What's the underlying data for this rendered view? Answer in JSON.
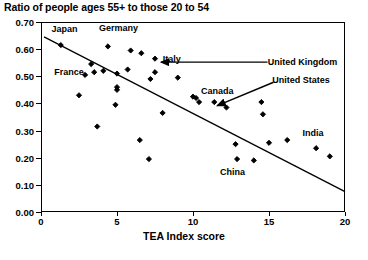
{
  "chart_data": {
    "type": "scatter",
    "title": "Ratio of people ages 55+ to those 20 to 54",
    "xlabel": "TEA Index score",
    "ylabel": "",
    "xlim": [
      0,
      20
    ],
    "ylim": [
      0.0,
      0.7
    ],
    "xticks": [
      0,
      5,
      10,
      15,
      20
    ],
    "xtick_labels": [
      "0",
      "5",
      "10",
      "15",
      "20"
    ],
    "yticks": [
      0.0,
      0.1,
      0.2,
      0.3,
      0.4,
      0.5,
      0.6,
      0.7
    ],
    "ytick_labels": [
      "0.00",
      "0.10",
      "0.20",
      "0.30",
      "0.40",
      "0.50",
      "0.60",
      "0.70"
    ],
    "grid": false,
    "legend": "none",
    "marker": "diamond",
    "marker_color": "#000000",
    "points": [
      {
        "x": 1.3,
        "y": 0.615
      },
      {
        "x": 3.3,
        "y": 0.545
      },
      {
        "x": 3.5,
        "y": 0.515
      },
      {
        "x": 2.9,
        "y": 0.505
      },
      {
        "x": 4.1,
        "y": 0.52
      },
      {
        "x": 4.4,
        "y": 0.61
      },
      {
        "x": 5.9,
        "y": 0.595
      },
      {
        "x": 6.6,
        "y": 0.585
      },
      {
        "x": 5.0,
        "y": 0.51
      },
      {
        "x": 5.7,
        "y": 0.525
      },
      {
        "x": 5.0,
        "y": 0.46
      },
      {
        "x": 5.0,
        "y": 0.45
      },
      {
        "x": 4.9,
        "y": 0.395
      },
      {
        "x": 2.5,
        "y": 0.43
      },
      {
        "x": 7.5,
        "y": 0.565
      },
      {
        "x": 7.5,
        "y": 0.515
      },
      {
        "x": 7.2,
        "y": 0.49
      },
      {
        "x": 9.0,
        "y": 0.495
      },
      {
        "x": 8.0,
        "y": 0.365
      },
      {
        "x": 3.7,
        "y": 0.315
      },
      {
        "x": 6.5,
        "y": 0.265
      },
      {
        "x": 7.1,
        "y": 0.195
      },
      {
        "x": 10.0,
        "y": 0.425
      },
      {
        "x": 10.2,
        "y": 0.42
      },
      {
        "x": 10.4,
        "y": 0.405
      },
      {
        "x": 11.4,
        "y": 0.405
      },
      {
        "x": 12.2,
        "y": 0.385
      },
      {
        "x": 14.5,
        "y": 0.405
      },
      {
        "x": 14.6,
        "y": 0.36
      },
      {
        "x": 12.8,
        "y": 0.25
      },
      {
        "x": 12.9,
        "y": 0.195
      },
      {
        "x": 14.0,
        "y": 0.19
      },
      {
        "x": 15.0,
        "y": 0.255
      },
      {
        "x": 16.2,
        "y": 0.265
      },
      {
        "x": 18.1,
        "y": 0.235
      },
      {
        "x": 19.0,
        "y": 0.205
      }
    ],
    "trendline": {
      "x0": 0.2,
      "y0": 0.645,
      "x1": 20.0,
      "y1": 0.075
    },
    "annotations": [
      {
        "label": "Japan",
        "lx": 1.55,
        "ly": 0.675,
        "arrow": false
      },
      {
        "label": "Germany",
        "lx": 5.1,
        "ly": 0.678,
        "arrow": false
      },
      {
        "label": "France",
        "lx": 1.85,
        "ly": 0.517,
        "arrow": false
      },
      {
        "label": "Italy",
        "lx": 8.6,
        "ly": 0.565,
        "arrow": false
      },
      {
        "label": "Canada",
        "lx": 11.6,
        "ly": 0.447,
        "arrow": false
      },
      {
        "label": "China",
        "lx": 12.6,
        "ly": 0.148,
        "arrow": false
      },
      {
        "label": "India",
        "lx": 17.9,
        "ly": 0.292,
        "arrow": false
      },
      {
        "label": "United Kingdom",
        "lx": 17.2,
        "ly": 0.552,
        "arrow": true
      },
      {
        "label": "United States",
        "lx": 17.1,
        "ly": 0.487,
        "arrow": true
      }
    ]
  }
}
